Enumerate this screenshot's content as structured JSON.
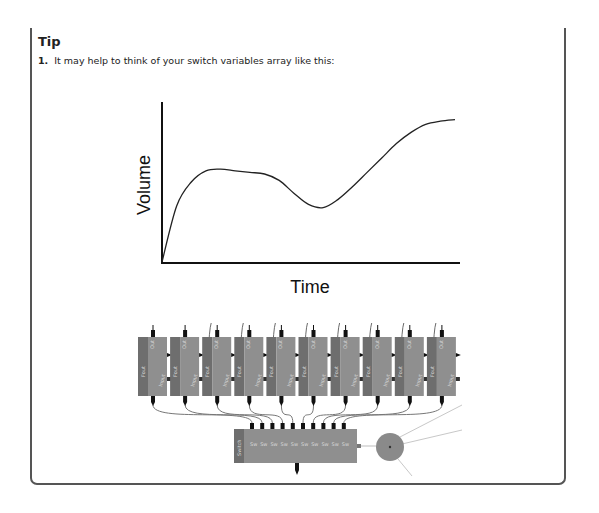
{
  "tip": {
    "title": "Tip",
    "step_number": "1.",
    "step_text": "It may help to think of your switch variables array like this:"
  },
  "figure": {
    "x_label": "Time",
    "y_label": "Volume"
  },
  "chart_data": {
    "type": "line",
    "title": "",
    "xlabel": "Time",
    "ylabel": "Volume",
    "grid": false,
    "ticks": "none",
    "x": [
      0,
      5,
      10,
      15,
      20,
      25,
      30,
      35,
      40,
      45,
      50,
      55,
      60,
      65,
      70,
      75,
      80,
      85,
      90,
      95,
      100
    ],
    "values": [
      0,
      35,
      50,
      57,
      58,
      57,
      56,
      55,
      51,
      43,
      36,
      34,
      39,
      47,
      56,
      65,
      74,
      81,
      86,
      88,
      89
    ],
    "xlim": [
      0,
      100
    ],
    "ylim": [
      0,
      100
    ]
  },
  "diagram": {
    "upper_node_count": 10,
    "upper_node_labels": [
      "Fout",
      "Out",
      "Input",
      "In"
    ],
    "array_node_label": "Switch",
    "array_input_count": 10,
    "colors": {
      "node_dark": "#6e6e6e",
      "node_light": "#8f8f8f",
      "terminal": "#111111",
      "wire": "#777777",
      "wire_light": "#c8c8c8",
      "circle": "#8a8a8a"
    }
  }
}
